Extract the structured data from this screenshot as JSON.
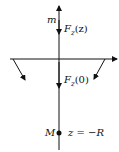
{
  "diagram": {
    "labels": {
      "small_mass": "m",
      "force_at_z": "F",
      "force_at_z_sub": "z",
      "force_at_z_arg": "(z)",
      "force_at_zero": "F",
      "force_at_zero_sub": "z",
      "force_at_zero_arg": "(0)",
      "large_mass": "M",
      "position": "z = −R"
    },
    "colors": {
      "stroke": "#111111",
      "background": "#ffffff"
    }
  }
}
